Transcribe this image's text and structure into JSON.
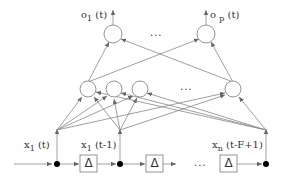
{
  "diagram": {
    "type": "time-delay neural network",
    "colors": {
      "stroke": "#777777",
      "node_fill": "#ffffff",
      "junction": "#000000",
      "text": "#333333"
    },
    "outputs": [
      {
        "name": "o",
        "sub": "1",
        "arg": " (t)"
      },
      {
        "name": "o",
        "sub": "p",
        "arg": " (t)"
      }
    ],
    "output_ellipsis": "...",
    "hidden_ellipsis": "...",
    "inputs": [
      {
        "name": "x",
        "sub": "1",
        "arg": " (t)"
      },
      {
        "name": "x",
        "sub": "1",
        "arg": " (t-1)"
      },
      {
        "name": "x",
        "sub": "n",
        "arg": " (t-F+1)"
      }
    ],
    "delay_label": "Δ",
    "delay_ellipsis": "..."
  }
}
